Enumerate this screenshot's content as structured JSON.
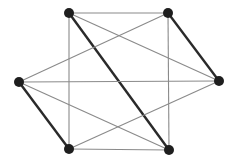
{
  "graph": {
    "title": "",
    "node_color": "#1e1e1e",
    "thin_edge_color": "#8a8a8a",
    "thick_edge_color": "#2a2a2a",
    "nodes": [
      {
        "id": "TL",
        "label": ""
      },
      {
        "id": "TR",
        "label": ""
      },
      {
        "id": "L",
        "label": ""
      },
      {
        "id": "R",
        "label": ""
      },
      {
        "id": "BL",
        "label": ""
      },
      {
        "id": "BR",
        "label": ""
      }
    ],
    "edges": [
      {
        "from": "TL",
        "to": "TR",
        "weight": "thin"
      },
      {
        "from": "TL",
        "to": "BL",
        "weight": "thin"
      },
      {
        "from": "TL",
        "to": "BR",
        "weight": "thick"
      },
      {
        "from": "TL",
        "to": "R",
        "weight": "thin"
      },
      {
        "from": "TR",
        "to": "BR",
        "weight": "thin"
      },
      {
        "from": "TR",
        "to": "L",
        "weight": "thin"
      },
      {
        "from": "TR",
        "to": "R",
        "weight": "thick"
      },
      {
        "from": "L",
        "to": "R",
        "weight": "thin"
      },
      {
        "from": "L",
        "to": "BL",
        "weight": "thick"
      },
      {
        "from": "L",
        "to": "BR",
        "weight": "thin"
      },
      {
        "from": "BL",
        "to": "BR",
        "weight": "thin"
      },
      {
        "from": "BL",
        "to": "R",
        "weight": "thin"
      }
    ]
  }
}
